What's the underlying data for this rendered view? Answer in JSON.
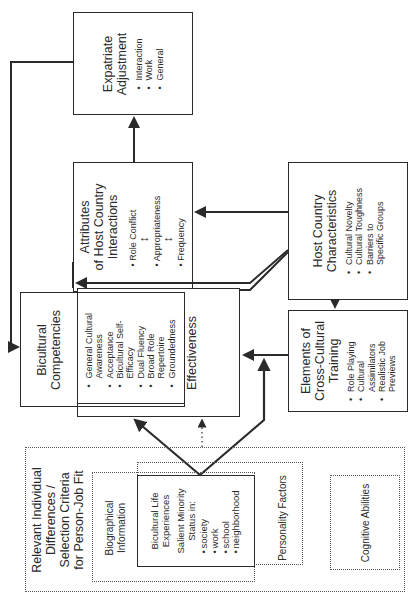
{
  "diagram": {
    "orientation": "rotated 90 degrees counter-clockwise",
    "nodes": {
      "expatriate_adjustment": {
        "title": "Expatriate Adjustment",
        "items": [
          "Interaction",
          "Work",
          "General"
        ]
      },
      "attributes_host_country_interactions": {
        "title_line1": "Attributes",
        "title_line2": "of Host Country",
        "title_line3": "Interactions",
        "items": [
          "Role Conflict",
          "Appropriateness",
          "Frequency"
        ],
        "item_connector": "↔"
      },
      "host_country_characteristics": {
        "title_line1": "Host Country",
        "title_line2": "Characteristics",
        "items": [
          "Cultural Novelty",
          "Cultural Toughness",
          "Barriers to Specific Groups"
        ]
      },
      "bicultural_competencies": {
        "title_line1": "Bicultural",
        "title_line2": "Competencies",
        "items": [
          "General Cultural Awareness",
          "Acceptance",
          "Bicultural Self-Efficacy",
          "Dual Fluency",
          "Broad Role Repertoire",
          "Groundedness"
        ]
      },
      "ksaos": {
        "title_line1": "KSAOs for",
        "title_line2": "Expatriate",
        "title_line3": "Effectiveness"
      },
      "cross_cultural_training": {
        "title_line1": "Elements of",
        "title_line2": "Cross-Cultural",
        "title_line3": "Training",
        "items": [
          "Role Playing",
          "Cultural Assimilators",
          "Realistic Job Previews"
        ]
      },
      "individual_differences": {
        "title_line1": "Relevant Individual",
        "title_line2": "Differences /",
        "title_line3": "Selection Criteria",
        "title_line4": "for Person-Job Fit"
      },
      "biographical_information": {
        "title_line1": "Biographical",
        "title_line2": "Information"
      },
      "bicultural_life_experiences": {
        "title_line1": "Bicultural Life",
        "title_line2": "Experiences",
        "subtitle_line1": "Salient Minority",
        "subtitle_line2": "Status in:",
        "items": [
          "society",
          "work",
          "school",
          "neighborhood"
        ]
      },
      "personality_factors": {
        "title": "Personality Factors"
      },
      "cognitive_abilities": {
        "title": "Cognitive Abilities"
      }
    },
    "edges": [
      {
        "from": "Bicultural Competencies",
        "to": "Expatriate Adjustment",
        "style": "solid"
      },
      {
        "from": "Attributes of Host Country Interactions",
        "to": "Expatriate Adjustment",
        "style": "solid"
      },
      {
        "from": "Host Country Characteristics",
        "to": "Attributes of Host Country Interactions",
        "style": "solid"
      },
      {
        "from": "Host Country Characteristics",
        "to": "Elements of Cross-Cultural Training",
        "style": "solid"
      },
      {
        "from": "Host Country Characteristics",
        "to": "Bicultural Competencies",
        "style": "solid"
      },
      {
        "from": "Elements of Cross-Cultural Training",
        "to": "KSAOs for Expatriate Effectiveness",
        "style": "solid"
      },
      {
        "from": "Bicultural Life Experiences",
        "to": "KSAOs for Expatriate Effectiveness",
        "style": "solid"
      },
      {
        "from": "Bicultural Life Experiences",
        "to": "Elements of Cross-Cultural Training",
        "style": "solid"
      },
      {
        "from": "Relevant Individual Differences",
        "to": "KSAOs for Expatriate Effectiveness",
        "style": "dotted"
      }
    ]
  }
}
